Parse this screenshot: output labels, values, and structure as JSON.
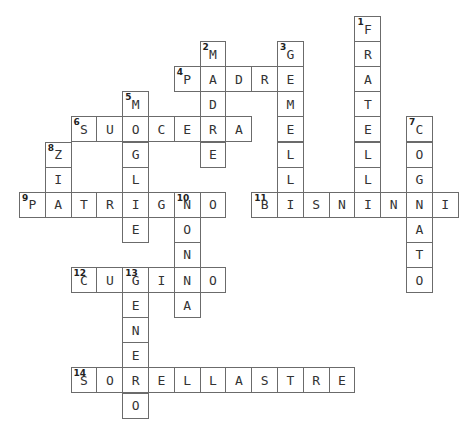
{
  "puzzle": {
    "type": "crossword",
    "grid_origin": {
      "x": 19,
      "y": 16
    },
    "cell_width": 25.8,
    "cell_height": 25.1,
    "colors": {
      "border": "#6b6b6b",
      "text": "#333333",
      "background": "#ffffff"
    },
    "words": [
      {
        "number": 1,
        "answer": "FRATELLI",
        "direction": "down",
        "row": 0,
        "col": 13
      },
      {
        "number": 2,
        "answer": "MADRE",
        "direction": "down",
        "row": 1,
        "col": 7
      },
      {
        "number": 3,
        "answer": "GEMELLI",
        "direction": "down",
        "row": 1,
        "col": 10
      },
      {
        "number": 4,
        "answer": "PADRE",
        "direction": "across",
        "row": 2,
        "col": 6
      },
      {
        "number": 5,
        "answer": "MOGLIE",
        "direction": "down",
        "row": 3,
        "col": 4
      },
      {
        "number": 6,
        "answer": "SUOCERA",
        "direction": "across",
        "row": 4,
        "col": 2
      },
      {
        "number": 7,
        "answer": "COGNATO",
        "direction": "down",
        "row": 4,
        "col": 15
      },
      {
        "number": 8,
        "answer": "ZIA",
        "direction": "down",
        "row": 5,
        "col": 1
      },
      {
        "number": 9,
        "answer": "PATRIGNO",
        "direction": "across",
        "row": 7,
        "col": 0
      },
      {
        "number": 10,
        "answer": "NONNA",
        "direction": "down",
        "row": 7,
        "col": 6
      },
      {
        "number": 11,
        "answer": "BISNONNI",
        "direction": "across",
        "row": 7,
        "col": 9
      },
      {
        "number": 12,
        "answer": "CUGINO",
        "direction": "across",
        "row": 10,
        "col": 2
      },
      {
        "number": 13,
        "answer": "GENERO",
        "direction": "down",
        "row": 10,
        "col": 4
      },
      {
        "number": 14,
        "answer": "SORELLASTRE",
        "direction": "across",
        "row": 14,
        "col": 2
      }
    ]
  }
}
